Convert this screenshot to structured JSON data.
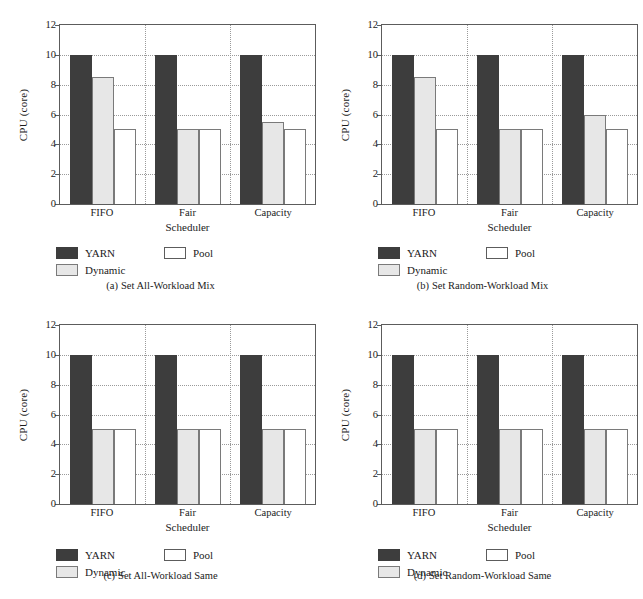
{
  "figure": {
    "panel_count": 4,
    "background": "#ffffff"
  },
  "colors": {
    "yarn": "#3d3d3d",
    "dynamic": "#e7e7e7",
    "pool": "#ffffff",
    "axis": "#5c5c5c",
    "grid": "#9a9a9a",
    "text": "#1b1b1b"
  },
  "axis": {
    "ylabel": "CPU (core)",
    "xlabel": "Scheduler",
    "yticks": [
      "0",
      "2",
      "4",
      "6",
      "8",
      "10",
      "12"
    ],
    "ymin": 0,
    "ymax": 12,
    "categories": [
      "FIFO",
      "Fair",
      "Capacity"
    ]
  },
  "legend": {
    "yarn": "YARN",
    "dynamic": "Dynamic",
    "pool": "Pool"
  },
  "panels": {
    "a": {
      "tag": "(a)",
      "caption": "Set All-Workload Mix"
    },
    "b": {
      "tag": "(b)",
      "caption": "Set Random-Workload Mix"
    },
    "c": {
      "tag": "(c)",
      "caption": "Set All-Workload Same"
    },
    "d": {
      "tag": "(d)",
      "caption": "Set Random-Workload Same"
    }
  },
  "chart_data": [
    {
      "type": "bar",
      "panel": "a",
      "title": "(a) Set All-Workload Mix",
      "xlabel": "Scheduler",
      "ylabel": "CPU (core)",
      "ylim": [
        0,
        12
      ],
      "yticks": [
        0,
        2,
        4,
        6,
        8,
        10,
        12
      ],
      "grid": "dotted",
      "legend_position": "below-plot",
      "categories": [
        "FIFO",
        "Fair",
        "Capacity"
      ],
      "series": [
        {
          "name": "YARN",
          "values": [
            10,
            10,
            10
          ]
        },
        {
          "name": "Dynamic",
          "values": [
            8.5,
            5,
            5.5
          ]
        },
        {
          "name": "Pool",
          "values": [
            5,
            5,
            5
          ]
        }
      ]
    },
    {
      "type": "bar",
      "panel": "b",
      "title": "(b) Set Random-Workload Mix",
      "xlabel": "Scheduler",
      "ylabel": "CPU (core)",
      "ylim": [
        0,
        12
      ],
      "yticks": [
        0,
        2,
        4,
        6,
        8,
        10,
        12
      ],
      "grid": "dotted",
      "legend_position": "below-plot",
      "categories": [
        "FIFO",
        "Fair",
        "Capacity"
      ],
      "series": [
        {
          "name": "YARN",
          "values": [
            10,
            10,
            10
          ]
        },
        {
          "name": "Dynamic",
          "values": [
            8.5,
            5,
            6
          ]
        },
        {
          "name": "Pool",
          "values": [
            5,
            5,
            5
          ]
        }
      ]
    },
    {
      "type": "bar",
      "panel": "c",
      "title": "(c) Set All-Workload Same",
      "xlabel": "Scheduler",
      "ylabel": "CPU (core)",
      "ylim": [
        0,
        12
      ],
      "yticks": [
        0,
        2,
        4,
        6,
        8,
        10,
        12
      ],
      "grid": "dotted",
      "legend_position": "below-plot",
      "categories": [
        "FIFO",
        "Fair",
        "Capacity"
      ],
      "series": [
        {
          "name": "YARN",
          "values": [
            10,
            10,
            10
          ]
        },
        {
          "name": "Dynamic",
          "values": [
            5,
            5,
            5
          ]
        },
        {
          "name": "Pool",
          "values": [
            5,
            5,
            5
          ]
        }
      ]
    },
    {
      "type": "bar",
      "panel": "d",
      "title": "(d) Set Random-Workload Same",
      "xlabel": "Scheduler",
      "ylabel": "CPU (core)",
      "ylim": [
        0,
        12
      ],
      "yticks": [
        0,
        2,
        4,
        6,
        8,
        10,
        12
      ],
      "grid": "dotted",
      "legend_position": "below-plot",
      "categories": [
        "FIFO",
        "Fair",
        "Capacity"
      ],
      "series": [
        {
          "name": "YARN",
          "values": [
            10,
            10,
            10
          ]
        },
        {
          "name": "Dynamic",
          "values": [
            5,
            5,
            5
          ]
        },
        {
          "name": "Pool",
          "values": [
            5,
            5,
            5
          ]
        }
      ]
    }
  ]
}
